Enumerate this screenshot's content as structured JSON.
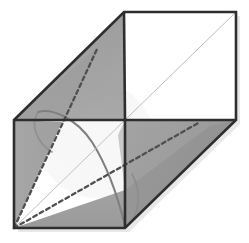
{
  "figure": {
    "title": "Cube with inscribed cone, oblique projection",
    "type": "geometric-solid-diagram",
    "canvas": {
      "width": 249,
      "height": 243,
      "background": "#ffffff"
    },
    "colors": {
      "outline": "#2e2e2e",
      "shade_light": "#a8a8a8",
      "shade_mid": "#9d9d9d",
      "shade_dark": "#8f8f8f",
      "face_white": "#ffffff",
      "thin_line": "#b0b0b0",
      "dashed_line": "#4a4a4a",
      "arc_line": "#7a7a7a",
      "shadow": "#cfcfcf"
    },
    "vertices": {
      "front_top_left": [
        14,
        120
      ],
      "front_top_right": [
        125,
        120
      ],
      "front_bottom_right": [
        125,
        228
      ],
      "front_bottom_left": [
        14,
        228
      ],
      "back_top_left": [
        124,
        12
      ],
      "back_top_right": [
        236,
        12
      ],
      "back_bottom_right": [
        236,
        120
      ],
      "back_bottom_left": [
        125,
        120
      ]
    },
    "faces": [
      {
        "name": "top-face",
        "fill": "shade_mid",
        "points": "14,120 124,12 236,12 125,120"
      },
      {
        "name": "back-face",
        "fill": "face_white",
        "points": "124,12 236,12 236,120 125,120"
      },
      {
        "name": "right-face",
        "fill": "shade_light",
        "points": "125,120 236,120 236,120 125,228"
      },
      {
        "name": "front-face",
        "fill": "face_white",
        "points": "14,120 125,120 125,228 14,228"
      }
    ],
    "cone": {
      "apex": [
        14,
        228
      ],
      "base_center": [
        180,
        66
      ],
      "base_rx": 56,
      "base_ry": 56,
      "style": "dashed",
      "description": "cone inscribed in cube, apex at front-bottom-left vertex"
    },
    "arc": {
      "name": "cross-section-ellipse",
      "style": "solid-thin",
      "description": "elliptical cross-section curve through cube interior"
    },
    "dashed_segments": [
      {
        "name": "cone-edge-upper",
        "from": [
          14,
          228
        ],
        "to": [
          98,
          47
        ]
      },
      {
        "name": "cone-edge-lower",
        "from": [
          14,
          228
        ],
        "to": [
          200,
          122
        ]
      }
    ],
    "thin_diagonals": [
      {
        "name": "back-face-diagonal",
        "from": [
          124,
          120
        ],
        "to": [
          236,
          12
        ]
      },
      {
        "name": "front-face-diagonal",
        "from": [
          14,
          228
        ],
        "to": [
          125,
          120
        ]
      }
    ]
  }
}
